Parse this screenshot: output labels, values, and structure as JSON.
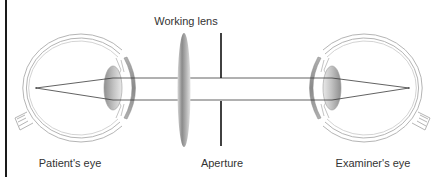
{
  "diagram": {
    "labels": {
      "working_lens": "Working lens",
      "patients_eye": "Patient's eye",
      "aperture": "Aperture",
      "examiners_eye": "Examiner's eye"
    },
    "components": [
      {
        "id": "patients_eye",
        "label": "Patient's eye",
        "position": "left"
      },
      {
        "id": "working_lens",
        "label": "Working lens",
        "position": "center-left"
      },
      {
        "id": "aperture",
        "label": "Aperture",
        "position": "center"
      },
      {
        "id": "examiners_eye",
        "label": "Examiner's eye",
        "position": "right"
      }
    ],
    "colors": {
      "outline": "#b5b5b5",
      "ray": "#3a3a3a",
      "aperture": "#111111",
      "lens_dark": "#8c8c8c",
      "lens_light": "#e6e6e6",
      "cornea": "#9a9a9a",
      "border": "#1a1a1a"
    }
  }
}
